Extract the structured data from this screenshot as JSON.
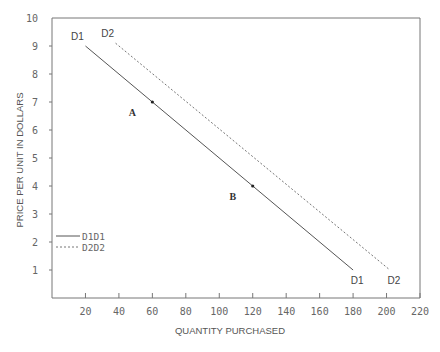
{
  "chart_data": {
    "type": "line",
    "title": "",
    "xlabel": "QUANTITY PURCHASED",
    "ylabel": "PRICE PER UNIT IN DOLLARS",
    "xlim": [
      0,
      220
    ],
    "ylim": [
      0,
      10
    ],
    "x_ticks": [
      20,
      40,
      60,
      80,
      100,
      120,
      140,
      160,
      180,
      200,
      220
    ],
    "y_ticks": [
      1,
      2,
      3,
      4,
      5,
      6,
      7,
      8,
      9,
      10
    ],
    "grid": false,
    "legend_position": "lower-left",
    "series": [
      {
        "name": "D1D1",
        "legend_label": "D1D1",
        "style": "solid",
        "color": "#555555",
        "start_label": "D1",
        "end_label": "D1",
        "points": [
          {
            "x": 20,
            "y": 9
          },
          {
            "x": 180,
            "y": 1
          }
        ]
      },
      {
        "name": "D2D2",
        "legend_label": "D2D2",
        "style": "dashed",
        "color": "#777777",
        "start_label": "D2",
        "end_label": "D2",
        "points": [
          {
            "x": 38,
            "y": 9.1
          },
          {
            "x": 202,
            "y": 1
          }
        ]
      }
    ],
    "annotations": [
      {
        "label": "A",
        "x": 60,
        "y": 7
      },
      {
        "label": "B",
        "x": 120,
        "y": 4
      }
    ]
  }
}
